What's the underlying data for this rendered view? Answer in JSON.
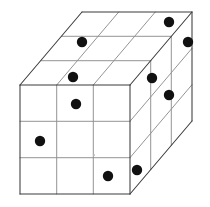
{
  "figure": {
    "title": "Three-dimensional cube grid with marked cells",
    "type": "axonometric-box-diagram",
    "canvas": {
      "width": 210,
      "height": 207,
      "background": "#ffffff"
    },
    "grid": {
      "columns": 3,
      "rows": 3,
      "layers": 3,
      "visible_faces": 3
    },
    "colors": {
      "outer_edge": "#3b3b3b",
      "inner_edge": "#8e8e8e",
      "face": "#ffffff",
      "dot": "#111111",
      "speck": "#b9b9b9"
    },
    "projection": {
      "front_origin_x": 20,
      "front_origin_y": 85,
      "cell_width": 36.7,
      "cell_height": 36.3,
      "depth_dx": 20.7,
      "depth_dy": -24.3
    },
    "dot_radius": 5.2,
    "dot_count": 10,
    "dots": [
      {
        "id": "front-r1-c2",
        "face": "front",
        "row": 1,
        "col": 2,
        "cx": 76,
        "cy": 104,
        "r": 5.2
      },
      {
        "id": "front-r2-c1",
        "face": "front",
        "row": 2,
        "col": 1,
        "cx": 40,
        "cy": 141,
        "r": 5.2
      },
      {
        "id": "front-r3-c3",
        "face": "front",
        "row": 3,
        "col": 3,
        "cx": 108,
        "cy": 176,
        "r": 5.2
      },
      {
        "id": "top-near-c2",
        "face": "top",
        "row": 3,
        "col": 2,
        "cx": 73,
        "cy": 77,
        "r": 5.2
      },
      {
        "id": "top-mid-c2",
        "face": "top",
        "row": 2,
        "col": 2,
        "cx": 82,
        "cy": 42,
        "r": 5.2
      },
      {
        "id": "top-far-c3",
        "face": "top",
        "row": 1,
        "col": 3,
        "cx": 169,
        "cy": 22,
        "r": 5.2
      },
      {
        "id": "right-r1-c3",
        "face": "right",
        "row": 1,
        "col": 3,
        "cx": 188,
        "cy": 42,
        "r": 5.2
      },
      {
        "id": "right-r1-c1",
        "face": "right",
        "row": 1,
        "col": 1,
        "cx": 152,
        "cy": 78,
        "r": 5.2
      },
      {
        "id": "right-r2-c2",
        "face": "right",
        "row": 2,
        "col": 2,
        "cx": 169,
        "cy": 95,
        "r": 5.2
      },
      {
        "id": "right-r3-c1",
        "face": "right",
        "row": 3,
        "col": 1,
        "cx": 137,
        "cy": 170,
        "r": 5.2
      }
    ],
    "faces": [
      {
        "id": "front-face",
        "label": "Front face",
        "points": "20,85 130,85 130,194 20,194"
      },
      {
        "id": "top-face",
        "label": "Top face",
        "points": "20,85 130,85 192,12 82,12"
      },
      {
        "id": "right-face",
        "label": "Right face",
        "points": "130,85 192,12 192,121 130,194"
      }
    ],
    "outer_outline": "20,85 82,12 192,12 192,121 130,194 20,194",
    "edges": {
      "outer": [
        "M20,85 L130,85",
        "M130,85 L130,194",
        "M20,85 L20,194",
        "M20,194 L130,194",
        "M20,85 L82,12",
        "M82,12 L192,12",
        "M130,85 L192,12",
        "M192,12 L192,121",
        "M130,194 L192,121"
      ],
      "front_vertical": [
        "M56.7,85 L56.7,194",
        "M93.3,85 L93.3,194"
      ],
      "front_horizontal": [
        "M20,121.3 L130,121.3",
        "M20,157.7 L130,157.7"
      ],
      "top_depth": [
        "M41,60.7 L151,60.7",
        "M61.3,36.3 L171.3,36.3"
      ],
      "top_columns": [
        "M56.7,85 L118.7,12",
        "M93.3,85 L155.3,12"
      ],
      "right_depth": [
        "M130,121.3 L192,48.3",
        "M130,157.7 L192,84.7"
      ],
      "right_columns": [
        "M150.7,60.7 L150.7,169.7",
        "M171.3,36.3 L171.3,145.3"
      ]
    },
    "specks": [
      {
        "id": "speck-front",
        "cx": 94,
        "cy": 155,
        "r": 1.0
      }
    ]
  }
}
